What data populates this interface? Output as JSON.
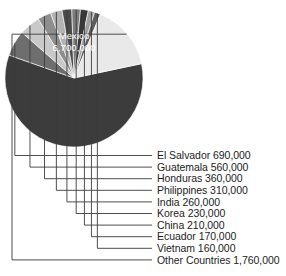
{
  "chart_data": {
    "type": "pie",
    "title": "",
    "xlabel": "",
    "ylabel": "",
    "legend_position": "callout-right",
    "grid": false,
    "value_unit": "people",
    "total": 11410000,
    "categories": [
      "Mexico",
      "El Salvador",
      "Guatemala",
      "Honduras",
      "Philippines",
      "India",
      "Korea",
      "China",
      "Ecuador",
      "Vietnam",
      "Other Countries"
    ],
    "values": [
      6700000,
      690000,
      560000,
      360000,
      310000,
      260000,
      230000,
      210000,
      170000,
      160000,
      1760000
    ],
    "value_labels": [
      "6,700,000",
      "690,000",
      "560,000",
      "360,000",
      "310,000",
      "260,000",
      "230,000",
      "210,000",
      "170,000",
      "160,000",
      "1,760,000"
    ],
    "slice_colors": [
      "#3c3c3c",
      "#6e6e6e",
      "#c9c9c9",
      "#8e8e8e",
      "#b3b3b3",
      "#4a4a4a",
      "#7d7d7d",
      "#383838",
      "#a0a0a0",
      "#5c5c5c",
      "#e9e9e9"
    ]
  },
  "pie": {
    "inside_label_name": "Mexico",
    "inside_label_value": "6,700,000",
    "inside_label_color": "#ffffff"
  },
  "callouts": [
    {
      "id": "el-salvador",
      "label": "El Salvador 690,000"
    },
    {
      "id": "guatemala",
      "label": "Guatemala 560,000"
    },
    {
      "id": "honduras",
      "label": "Honduras 360,000"
    },
    {
      "id": "philippines",
      "label": "Philippines 310,000"
    },
    {
      "id": "india",
      "label": "India 260,000"
    },
    {
      "id": "korea",
      "label": "Korea 230,000"
    },
    {
      "id": "china",
      "label": "China 210,000"
    },
    {
      "id": "ecuador",
      "label": "Ecuador 170,000"
    },
    {
      "id": "vietnam",
      "label": "Vietnam 160,000"
    },
    {
      "id": "other",
      "label": "Other Countries 1,760,000"
    }
  ]
}
